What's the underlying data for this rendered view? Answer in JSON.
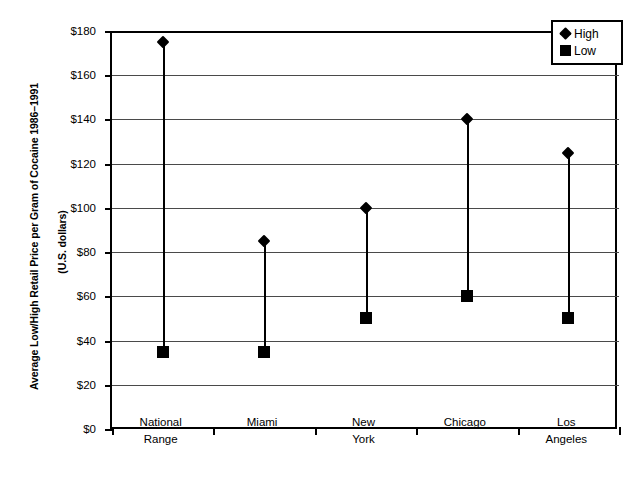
{
  "chart_data": {
    "type": "scatter",
    "title": "",
    "xlabel": "",
    "ylabel_line1": "Average Low/High Retail Price per Gram of Cocaine 1986–1991",
    "ylabel_line2": "(U.S. dollars)",
    "categories": [
      "National Range",
      "Miami",
      "New York",
      "Chicago",
      "Los Angeles"
    ],
    "category_lines": [
      [
        "National",
        "Range"
      ],
      [
        "Miami",
        ""
      ],
      [
        "New",
        "York"
      ],
      [
        "Chicago",
        ""
      ],
      [
        "Los",
        "Angeles"
      ]
    ],
    "series": [
      {
        "name": "High",
        "marker": "diamond",
        "values": [
          175,
          85,
          100,
          140,
          125
        ]
      },
      {
        "name": "Low",
        "marker": "square",
        "values": [
          35,
          35,
          50,
          60,
          50
        ]
      }
    ],
    "ylim": [
      0,
      180
    ],
    "ytick_step": 20,
    "ytick_labels": [
      "$180",
      "$160",
      "$140",
      "$120",
      "$100",
      "$80",
      "$60",
      "$40",
      "$20",
      "$0"
    ],
    "ytick_values": [
      180,
      160,
      140,
      120,
      100,
      80,
      60,
      40,
      20,
      0
    ],
    "grid": true,
    "legend_position": "top-right",
    "legend_entries": [
      {
        "label": "High",
        "marker": "diamond"
      },
      {
        "label": "Low",
        "marker": "square"
      }
    ],
    "colors": {
      "series": "#000000",
      "grid": "#4a4a4a",
      "axis": "#000000",
      "background": "#ffffff"
    }
  }
}
